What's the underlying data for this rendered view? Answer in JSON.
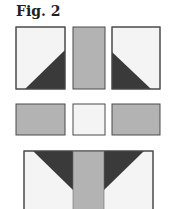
{
  "figure": {
    "caption": "Fig. 2",
    "colors": {
      "light": "#f4f4f4",
      "medium": "#b3b3b3",
      "dark": "#3a3a3a",
      "stroke": "#4a4a4a"
    },
    "rows": [
      {
        "name": "top-row",
        "blocks": [
          {
            "name": "half-square-triangle-left",
            "fill": "light",
            "triangle": "bottom-right-dark"
          },
          {
            "name": "gray-rectangle-vertical",
            "fill": "medium"
          },
          {
            "name": "half-square-triangle-right",
            "fill": "light",
            "triangle": "bottom-left-dark"
          }
        ]
      },
      {
        "name": "middle-row",
        "blocks": [
          {
            "name": "gray-rectangle-left",
            "fill": "medium"
          },
          {
            "name": "white-square-center",
            "fill": "light"
          },
          {
            "name": "gray-rectangle-right",
            "fill": "medium"
          }
        ]
      },
      {
        "name": "bottom-row",
        "blocks": [
          {
            "name": "assembled-unit",
            "fill": "light",
            "strip": "medium",
            "triangles": "dark"
          }
        ]
      }
    ]
  }
}
